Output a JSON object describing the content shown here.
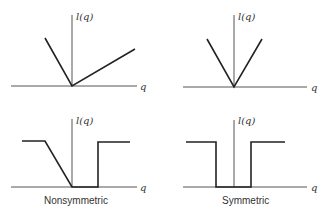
{
  "panels": [
    {
      "id": "top-left",
      "ylabel": "l(q)",
      "xlabel": "q",
      "caption": "",
      "curve": [
        [
          45,
          38
        ],
        [
          72,
          86
        ],
        [
          135,
          49
        ]
      ],
      "axes": {
        "x": [
          11,
          137,
          86
        ],
        "y": [
          72,
          15,
          86
        ]
      }
    },
    {
      "id": "top-right",
      "ylabel": "l(q)",
      "xlabel": "q",
      "caption": "",
      "curve": [
        [
          207,
          39
        ],
        [
          234,
          87
        ],
        [
          262,
          39
        ]
      ],
      "axes": {
        "x": [
          183,
          307,
          87
        ],
        "y": [
          234,
          15,
          87
        ]
      }
    },
    {
      "id": "bottom-left",
      "ylabel": "l(q)",
      "xlabel": "q",
      "caption": "Nonsymmetric",
      "curve": [
        [
          22,
          141
        ],
        [
          45,
          141
        ],
        [
          72,
          187
        ],
        [
          98,
          187
        ],
        [
          98,
          142
        ],
        [
          130,
          142
        ]
      ],
      "axes": {
        "x": [
          11,
          137,
          187
        ],
        "y": [
          72,
          119,
          187
        ]
      }
    },
    {
      "id": "bottom-right",
      "ylabel": "l(q)",
      "xlabel": "q",
      "caption": "Symmetric",
      "curve": [
        [
          186,
          142
        ],
        [
          216,
          142
        ],
        [
          216,
          187
        ],
        [
          251,
          187
        ],
        [
          251,
          142
        ],
        [
          285,
          142
        ]
      ],
      "axes": {
        "x": [
          183,
          307,
          187
        ],
        "y": [
          234,
          120,
          187
        ]
      }
    }
  ]
}
